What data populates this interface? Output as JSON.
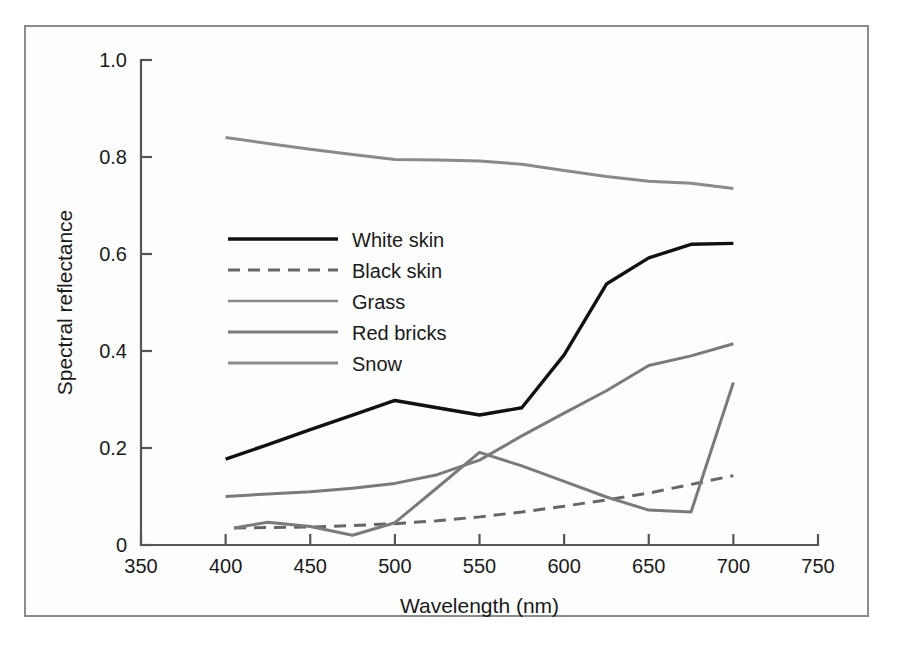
{
  "figure": {
    "background_color": "#fdfdfd",
    "frame_color": "#8b8b8b",
    "axis_color": "#555555"
  },
  "chart_data": {
    "type": "line",
    "title": "",
    "xlabel": "Wavelength (nm)",
    "ylabel": "Spectral reflectance",
    "xlim": [
      350,
      750
    ],
    "ylim": [
      0,
      1.0
    ],
    "xticks": [
      350,
      400,
      450,
      500,
      550,
      600,
      650,
      700,
      750
    ],
    "xtick_labels": [
      "350",
      "400",
      "450",
      "500",
      "550",
      "600",
      "650",
      "700",
      "750"
    ],
    "yticks": [
      0,
      0.2,
      0.4,
      0.6,
      0.8,
      1.0
    ],
    "ytick_labels": [
      "0",
      "0.2",
      "0.4",
      "0.6",
      "0.8",
      "1.0"
    ],
    "grid": false,
    "legend_position": "upper-left-inside",
    "series": [
      {
        "name": "White skin",
        "color": "#111111",
        "width": 3.4,
        "dash": "none",
        "x": [
          400,
          425,
          450,
          475,
          500,
          525,
          550,
          575,
          600,
          625,
          650,
          675,
          700
        ],
        "y": [
          0.177,
          0.207,
          0.238,
          0.268,
          0.298,
          0.283,
          0.268,
          0.283,
          0.392,
          0.538,
          0.592,
          0.62,
          0.622
        ]
      },
      {
        "name": "Black skin",
        "color": "#666666",
        "width": 3.0,
        "dash": "12,8",
        "x": [
          405,
          425,
          450,
          475,
          500,
          525,
          550,
          575,
          600,
          625,
          650,
          675,
          700
        ],
        "y": [
          0.035,
          0.036,
          0.037,
          0.04,
          0.044,
          0.05,
          0.058,
          0.068,
          0.08,
          0.093,
          0.107,
          0.125,
          0.143
        ]
      },
      {
        "name": "Grass",
        "color": "#7a7a7a",
        "width": 3.0,
        "dash": "none",
        "x": [
          405,
          425,
          450,
          475,
          500,
          525,
          550,
          575,
          600,
          625,
          650,
          675,
          700
        ],
        "y": [
          0.035,
          0.047,
          0.038,
          0.02,
          0.046,
          0.118,
          0.191,
          0.163,
          0.131,
          0.099,
          0.072,
          0.068,
          0.335
        ]
      },
      {
        "name": "Red bricks",
        "color": "#7a7a7a",
        "width": 3.0,
        "dash": "none",
        "x": [
          400,
          425,
          450,
          475,
          500,
          525,
          550,
          575,
          600,
          625,
          650,
          675,
          700
        ],
        "y": [
          0.1,
          0.105,
          0.11,
          0.117,
          0.127,
          0.145,
          0.175,
          0.225,
          0.272,
          0.318,
          0.37,
          0.39,
          0.415
        ]
      },
      {
        "name": "Snow",
        "color": "#8a8a8a",
        "width": 3.0,
        "dash": "none",
        "x": [
          400,
          425,
          450,
          475,
          500,
          525,
          550,
          575,
          600,
          625,
          650,
          675,
          700
        ],
        "y": [
          0.84,
          0.828,
          0.816,
          0.805,
          0.795,
          0.794,
          0.792,
          0.785,
          0.772,
          0.76,
          0.75,
          0.746,
          0.735
        ]
      }
    ],
    "legend_entries": [
      {
        "label": "White skin",
        "color": "#111111",
        "dash": "none",
        "width": 3.6
      },
      {
        "label": "Black skin",
        "color": "#666666",
        "dash": "12,8",
        "width": 3.2
      },
      {
        "label": "Grass",
        "color": "#8a8a8a",
        "dash": "none",
        "width": 2.6
      },
      {
        "label": "Red bricks",
        "color": "#7a7a7a",
        "dash": "none",
        "width": 2.8
      },
      {
        "label": "Snow",
        "color": "#8a8a8a",
        "dash": "none",
        "width": 2.8
      }
    ]
  }
}
